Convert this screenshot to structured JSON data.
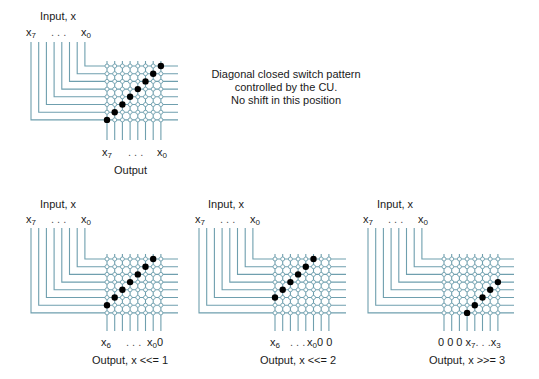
{
  "colors": {
    "wire": "#6f9fae",
    "closed_switch": "#000000",
    "open_switch_fill": "#ffffff",
    "text": "#1a1a1a",
    "background": "#ffffff"
  },
  "note": {
    "lines": [
      "Diagonal closed switch pattern",
      "controlled by the CU.",
      "No shift in this position"
    ]
  },
  "diagrams": [
    {
      "id": "no-shift",
      "input_label": "Input, x",
      "input_bits_left": {
        "base": "x",
        "sub": "7"
      },
      "input_dots": ". . .",
      "input_bits_right": {
        "base": "x",
        "sub": "0"
      },
      "output_left": {
        "base": "x",
        "sub": "7",
        "suffix": ""
      },
      "output_dots": ". . .",
      "output_right": {
        "base": "x",
        "sub": "0",
        "suffix": ""
      },
      "output_prefix": "",
      "caption": "Output",
      "closed_switches": [
        [
          0,
          7
        ],
        [
          1,
          6
        ],
        [
          2,
          5
        ],
        [
          3,
          4
        ],
        [
          4,
          3
        ],
        [
          5,
          2
        ],
        [
          6,
          1
        ],
        [
          7,
          0
        ]
      ],
      "geom": {
        "in_x0": 31,
        "grid_x0": 107,
        "line_top": 42,
        "row_y0": 66,
        "pitch": 7.7,
        "line_end_x": 178,
        "out_bottom": 140,
        "label_y": 146,
        "caption_y": 163
      }
    },
    {
      "id": "shift-left-1",
      "input_label": "Input, x",
      "input_bits_left": {
        "base": "x",
        "sub": "7"
      },
      "input_dots": ". . .",
      "input_bits_right": {
        "base": "x",
        "sub": "0"
      },
      "output_left": {
        "base": "x",
        "sub": "6",
        "suffix": ""
      },
      "output_dots": ". . .",
      "output_right": {
        "base": "x",
        "sub": "0",
        "suffix": "0"
      },
      "output_prefix": "",
      "caption": "Output, x <<= 1",
      "closed_switches": [
        [
          0,
          6
        ],
        [
          1,
          5
        ],
        [
          2,
          4
        ],
        [
          3,
          3
        ],
        [
          4,
          2
        ],
        [
          5,
          1
        ],
        [
          6,
          0
        ]
      ],
      "geom": {
        "in_x0": 31,
        "grid_x0": 107,
        "line_top": 228,
        "row_y0": 259,
        "pitch": 7.7,
        "line_end_x": 178,
        "out_bottom": 331,
        "label_y": 336,
        "caption_y": 355
      }
    },
    {
      "id": "shift-left-2",
      "input_label": "Input, x",
      "input_bits_left": {
        "base": "x",
        "sub": "7"
      },
      "input_dots": ". . .",
      "input_bits_right": {
        "base": "x",
        "sub": "0"
      },
      "output_left": {
        "base": "x",
        "sub": "6",
        "suffix": ""
      },
      "output_dots": ". . .",
      "output_right": {
        "base": "x",
        "sub": "0",
        "suffix": "0 0"
      },
      "output_prefix": "",
      "caption": "Output, x <<= 2",
      "closed_switches": [
        [
          0,
          5
        ],
        [
          1,
          4
        ],
        [
          2,
          3
        ],
        [
          3,
          2
        ],
        [
          4,
          1
        ],
        [
          5,
          0
        ]
      ],
      "geom": {
        "in_x0": 199,
        "grid_x0": 275,
        "line_top": 228,
        "row_y0": 259,
        "pitch": 7.7,
        "line_end_x": 346,
        "out_bottom": 331,
        "label_y": 336,
        "caption_y": 355
      }
    },
    {
      "id": "shift-right-3",
      "input_label": "Input, x",
      "input_bits_left": {
        "base": "x",
        "sub": "7"
      },
      "input_dots": ". . .",
      "input_bits_right": {
        "base": "x",
        "sub": "0"
      },
      "output_left": {
        "base": "x",
        "sub": "7",
        "suffix": ""
      },
      "output_dots": ". . .",
      "output_right": {
        "base": "x",
        "sub": "3",
        "suffix": ""
      },
      "output_prefix": "0 0 0 ",
      "caption": "Output, x >>= 3",
      "closed_switches": [
        [
          3,
          7
        ],
        [
          4,
          6
        ],
        [
          5,
          5
        ],
        [
          6,
          4
        ],
        [
          7,
          3
        ]
      ],
      "geom": {
        "in_x0": 368,
        "grid_x0": 444,
        "line_top": 228,
        "row_y0": 259,
        "pitch": 7.7,
        "line_end_x": 514,
        "out_bottom": 331,
        "label_y": 336,
        "caption_y": 355
      }
    }
  ]
}
